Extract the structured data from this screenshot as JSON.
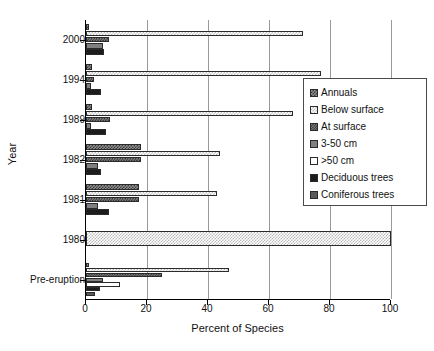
{
  "chart_data": {
    "type": "bar",
    "orientation": "horizontal",
    "title": "",
    "xlabel": "Percent of Species",
    "ylabel": "Year",
    "xlim": [
      0,
      100
    ],
    "xticks": [
      0,
      20,
      40,
      60,
      80,
      100
    ],
    "grid": "vertical",
    "legend_position": "right-inside",
    "categories": [
      "2000",
      "1994",
      "1989",
      "1982",
      "1981",
      "1980",
      "Pre-eruption"
    ],
    "series": [
      {
        "name": "Annuals",
        "pattern": "dark-checker",
        "color": "#8d8d8d",
        "values": [
          1,
          2,
          2,
          18,
          17.5,
          0,
          1
        ]
      },
      {
        "name": "Below surface",
        "pattern": "light-stipple",
        "color": "#ffffff",
        "values": [
          71,
          77,
          68,
          44,
          43,
          100,
          47
        ]
      },
      {
        "name": "At surface",
        "pattern": "mid-checker",
        "color": "#7c7c7c",
        "values": [
          7.5,
          2.5,
          8,
          18,
          17.5,
          0,
          25
        ]
      },
      {
        "name": "3-50 cm",
        "pattern": "solid-gray",
        "color": "#808080",
        "values": [
          5.5,
          1.5,
          1.5,
          4,
          4,
          0,
          5.5
        ]
      },
      {
        "name": ">50 cm",
        "pattern": "white",
        "color": "#ffffff",
        "values": [
          0,
          0,
          0,
          0,
          0,
          0,
          11
        ]
      },
      {
        "name": "Deciduous trees",
        "pattern": "solid-black",
        "color": "#1c1c1c",
        "values": [
          6,
          5,
          6.5,
          5,
          7.5,
          0,
          4.5
        ]
      },
      {
        "name": "Coniferous trees",
        "pattern": "dark-gray",
        "color": "#5a5a5a",
        "values": [
          0,
          0,
          0,
          0,
          0,
          0,
          3
        ]
      }
    ]
  },
  "axes": {
    "x_title": "Percent of Species",
    "y_title": "Year",
    "x_tick_labels": [
      "0",
      "20",
      "40",
      "60",
      "80",
      "100"
    ],
    "y_tick_labels": [
      "2000",
      "1994",
      "1989",
      "1982",
      "1981",
      "1980",
      "Pre-eruption"
    ]
  },
  "legend": {
    "items": [
      {
        "label": "Annuals"
      },
      {
        "label": "Below surface"
      },
      {
        "label": "At surface"
      },
      {
        "label": "3-50 cm"
      },
      {
        "label": ">50 cm"
      },
      {
        "label": "Deciduous trees"
      },
      {
        "label": "Coniferous trees"
      }
    ]
  }
}
